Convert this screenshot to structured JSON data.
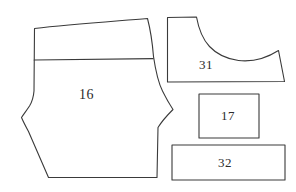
{
  "diagram": {
    "background_color": "#ffffff",
    "line_color": "#3a3a3a",
    "pieces": [
      {
        "id": "piece-16",
        "label": "16",
        "shape": "body-panel-with-yoke",
        "description": "Large hexagonal body panel with curved side seams and a horizontal yoke seam near the top",
        "label_position": {
          "x": 79,
          "y": 87
        }
      },
      {
        "id": "piece-31",
        "label": "31",
        "shape": "curved-boot-sole",
        "description": "Tall left riser with a concave sweeping curve to a low flared right end",
        "label_position": {
          "x": 199,
          "y": 57
        }
      },
      {
        "id": "piece-17",
        "label": "17",
        "shape": "rectangle",
        "description": "Small upright rectangle",
        "label_position": {
          "x": 221,
          "y": 108
        }
      },
      {
        "id": "piece-32",
        "label": "32",
        "shape": "rectangle",
        "description": "Wide short rectangle strip",
        "label_position": {
          "x": 218,
          "y": 155
        }
      }
    ]
  }
}
